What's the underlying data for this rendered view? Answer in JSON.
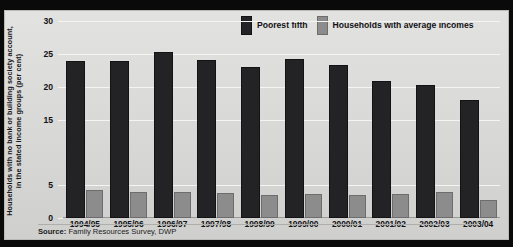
{
  "chart_data": {
    "type": "bar",
    "title": "",
    "xlabel": "",
    "ylabel": "Households with no bank or building society account, in the stated income groups (per cent)",
    "ylim": [
      0,
      30
    ],
    "ytick_labels": [
      "0",
      "5",
      "15",
      "20",
      "25",
      "30"
    ],
    "ytick_values": [
      0,
      5,
      15,
      20,
      25,
      30
    ],
    "grid": true,
    "legend_position": "top-right",
    "categories": [
      "1994/95",
      "1995/96",
      "1996/97",
      "1997/98",
      "1998/99",
      "1999/00",
      "2000/01",
      "2001/02",
      "2002/03",
      "2003/04"
    ],
    "series": [
      {
        "name": "Poorest fifth",
        "color": "#232326",
        "values": [
          23.9,
          23.9,
          25.3,
          24.0,
          23.0,
          24.2,
          23.3,
          20.9,
          20.3,
          18.0
        ]
      },
      {
        "name": "Households with average incomes",
        "color": "#8c8c8c",
        "values": [
          4.3,
          4.0,
          4.0,
          3.8,
          3.5,
          3.6,
          3.5,
          3.6,
          4.0,
          2.8
        ]
      }
    ],
    "source_prefix": "Source:",
    "source_text": " Family Resources Survey, DWP"
  }
}
